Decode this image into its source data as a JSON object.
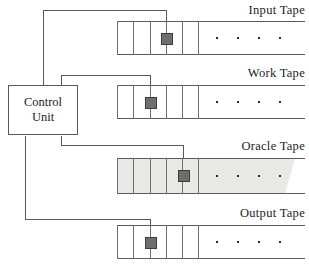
{
  "diagram": {
    "control_unit": {
      "line1": "Control",
      "line2": "Unit"
    },
    "colors": {
      "stroke": "#5a5a5a",
      "cell_divider": "#6f6f6f",
      "head_fill": "#6e6e6e",
      "head_border": "#3c3c3c",
      "oracle_shade": "#e8e8e6",
      "text": "#1d1d1d",
      "background": "#ffffff"
    },
    "tapes": [
      {
        "id": "input",
        "label": "Input Tape",
        "shaded": false,
        "cells": 6,
        "head_cell_index": 2,
        "dots": 4
      },
      {
        "id": "work",
        "label": "Work Tape",
        "shaded": false,
        "cells": 6,
        "head_cell_index": 1,
        "dots": 4
      },
      {
        "id": "oracle",
        "label": "Oracle Tape",
        "shaded": true,
        "cells": 6,
        "head_cell_index": 3,
        "dots": 4
      },
      {
        "id": "output",
        "label": "Output Tape",
        "shaded": false,
        "cells": 6,
        "head_cell_index": 1,
        "dots": 4
      }
    ]
  }
}
